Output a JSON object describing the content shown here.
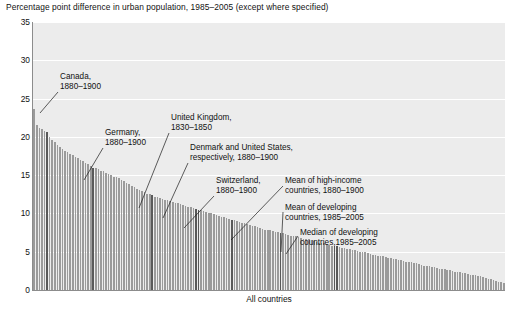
{
  "chart_data": {
    "type": "bar",
    "title": "Percentage point difference in urban population, 1985–2005 (except where specified)",
    "xlabel": "All countries",
    "ylabel": "",
    "ylim": [
      0,
      35
    ],
    "ytick_labels": [
      "35",
      "30",
      "25",
      "20",
      "15",
      "10",
      "5",
      "0"
    ],
    "yticks": [
      35,
      30,
      25,
      20,
      15,
      10,
      5,
      0
    ],
    "grid": true,
    "legend_position": "none",
    "bar_color": "#9a9a9a",
    "highlight_color": "#595959",
    "plot_background": "#ececec",
    "categories_note": "Countries sorted in descending order of percentage point difference; individual country names are not printed on the axis.",
    "values": [
      23.6,
      21.6,
      21.2,
      21.0,
      20.8,
      20.6,
      20.0,
      19.6,
      19.3,
      19.0,
      18.7,
      18.4,
      18.2,
      18.0,
      17.8,
      17.6,
      17.4,
      17.2,
      17.0,
      16.8,
      16.6,
      16.4,
      16.2,
      16.0,
      15.9,
      15.8,
      15.6,
      15.5,
      15.3,
      15.2,
      15.0,
      14.8,
      14.7,
      14.6,
      14.4,
      14.2,
      14.0,
      13.8,
      13.6,
      13.4,
      13.2,
      13.0,
      12.9,
      12.8,
      12.6,
      12.5,
      12.4,
      12.2,
      12.1,
      12.0,
      11.9,
      11.8,
      11.7,
      11.6,
      11.5,
      11.4,
      11.3,
      11.2,
      11.1,
      11.0,
      10.9,
      10.8,
      10.7,
      10.6,
      10.5,
      10.4,
      10.3,
      10.2,
      10.1,
      10.0,
      9.9,
      9.8,
      9.7,
      9.6,
      9.5,
      9.4,
      9.3,
      9.2,
      9.1,
      9.0,
      8.9,
      8.8,
      8.7,
      8.6,
      8.5,
      8.4,
      8.3,
      8.2,
      8.1,
      8.0,
      7.9,
      7.8,
      7.8,
      7.7,
      7.6,
      7.6,
      7.5,
      7.4,
      7.3,
      7.2,
      7.1,
      7.0,
      7.0,
      6.9,
      6.8,
      6.7,
      6.6,
      6.6,
      6.5,
      6.4,
      6.3,
      6.2,
      6.2,
      6.1,
      6.0,
      5.9,
      5.8,
      5.8,
      5.7,
      5.6,
      5.5,
      5.5,
      5.4,
      5.3,
      5.2,
      5.2,
      5.1,
      5.0,
      4.9,
      4.9,
      4.8,
      4.7,
      4.6,
      4.6,
      4.5,
      4.4,
      4.4,
      4.3,
      4.2,
      4.2,
      4.1,
      4.0,
      3.9,
      3.9,
      3.8,
      3.7,
      3.7,
      3.6,
      3.5,
      3.5,
      3.4,
      3.3,
      3.2,
      3.2,
      3.1,
      3.0,
      3.0,
      2.9,
      2.8,
      2.8,
      2.7,
      2.6,
      2.6,
      2.5,
      2.4,
      2.4,
      2.3,
      2.2,
      2.2,
      2.1,
      2.0,
      2.0,
      1.9,
      1.8,
      1.8,
      1.7,
      1.6,
      1.5,
      1.4,
      1.3,
      1.2,
      1.1,
      1.0,
      0.9
    ],
    "highlight_indices": [
      5,
      23,
      46,
      63,
      64,
      77,
      96,
      117,
      118
    ],
    "annotations": [
      {
        "id": "canada",
        "text": "Canada,\n1880–1900",
        "value": 20.6,
        "label_x": 60,
        "label_y": 72,
        "line": [
          58,
          92,
          40,
          113
        ]
      },
      {
        "id": "germany",
        "text": "Germany,\n1880–1900",
        "value": 16.0,
        "label_x": 105,
        "label_y": 128,
        "line": [
          103,
          148,
          84,
          180
        ]
      },
      {
        "id": "united-kingdom",
        "text": "United Kingdom,\n1830–1850",
        "value": 12.4,
        "label_x": 171,
        "label_y": 113,
        "line": [
          169,
          133,
          139,
          208
        ]
      },
      {
        "id": "denmark-united-states",
        "text": "Denmark and United States,\nrespectively, 1880–1900",
        "value": 10.5,
        "label_x": 190,
        "label_y": 143,
        "line": [
          188,
          163,
          163,
          218
        ]
      },
      {
        "id": "switzerland",
        "text": "Switzerland,\n1880–1900",
        "value": 9.2,
        "label_x": 216,
        "label_y": 176,
        "line": [
          214,
          196,
          184,
          228
        ]
      },
      {
        "id": "mean-high-income",
        "text": "Mean of high-income\ncountries, 1880–1900",
        "value": 7.5,
        "label_x": 285,
        "label_y": 176,
        "line": [
          283,
          186,
          231,
          240
        ]
      },
      {
        "id": "mean-developing",
        "text": "Mean of developing\ncountries, 1985–2005",
        "value": 6.0,
        "label_x": 285,
        "label_y": 203,
        "line": [
          283,
          212,
          281,
          252
        ]
      },
      {
        "id": "median-developing",
        "text": "Median of developing\ncountries,1985–2005",
        "value": 5.8,
        "label_x": 300,
        "label_y": 228,
        "line": [
          298,
          236,
          286,
          254
        ]
      }
    ]
  }
}
